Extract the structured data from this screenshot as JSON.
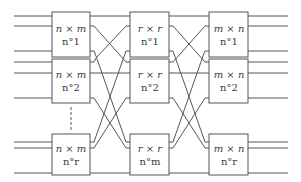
{
  "diagram": {
    "type": "clos-network",
    "colors": {
      "line": "#555555",
      "text": "#3a3a3a",
      "background": "#ffffff"
    },
    "stages": [
      {
        "name": "input-stage",
        "boxes": [
          {
            "dim": "n × m",
            "num": "n°1"
          },
          {
            "dim": "n × m",
            "num": "n°2"
          },
          {
            "dim": "n × m",
            "num": "n°r"
          }
        ]
      },
      {
        "name": "middle-stage",
        "boxes": [
          {
            "dim": "r × r",
            "num": "n°1"
          },
          {
            "dim": "r × r",
            "num": "n°2"
          },
          {
            "dim": "r × r",
            "num": "n°m"
          }
        ]
      },
      {
        "name": "output-stage",
        "boxes": [
          {
            "dim": "m × n",
            "num": "n°1"
          },
          {
            "dim": "m × n",
            "num": "n°2"
          },
          {
            "dim": "m × n",
            "num": "n°r"
          }
        ]
      }
    ],
    "ellipsis": "vertical dashed line between input boxes n°2 and n°r"
  }
}
